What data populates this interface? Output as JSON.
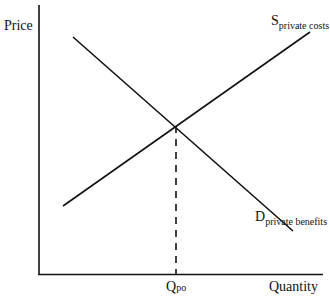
{
  "diagram": {
    "title": "",
    "y_axis_label": "Price",
    "x_axis_label": "Quantity",
    "curves": [
      {
        "id": "supply",
        "label_main": "S",
        "label_sub": "private costs",
        "slope": "upward"
      },
      {
        "id": "demand",
        "label_main": "D",
        "label_sub": "private benefits",
        "slope": "downward"
      }
    ],
    "equilibrium": {
      "quantity_label_main": "Q",
      "quantity_label_sub": "po",
      "guide": "dashed vertical line from intersection to quantity axis"
    },
    "colors": {
      "line": "#111111",
      "background": "#ffffff"
    }
  }
}
